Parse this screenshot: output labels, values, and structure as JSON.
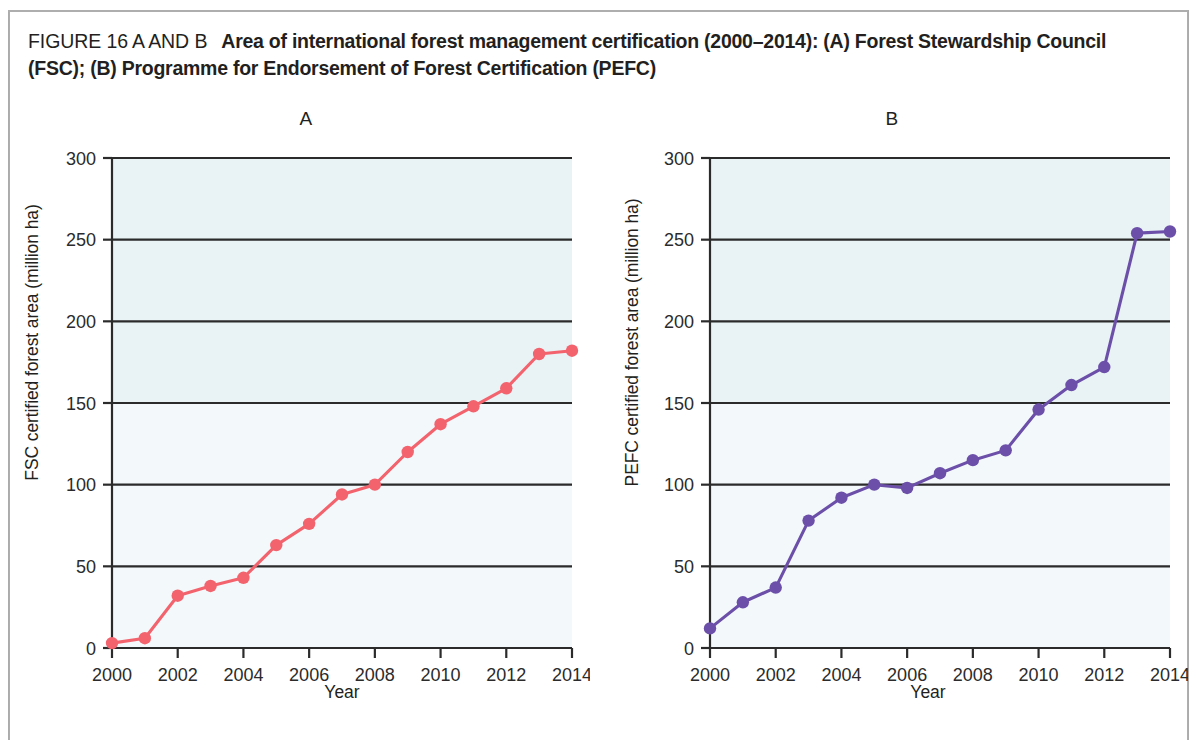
{
  "caption": {
    "figure_label": "FIGURE 16 A AND B",
    "title": "Area of international forest management certification (2000–2014): (A) Forest Stewardship Council (FSC); (B) Programme for Endorsement of Forest Certification (PEFC)"
  },
  "colors": {
    "panel_a_series": "#f2636e",
    "panel_b_series": "#6b4fa8",
    "plot_band_tint": "#e9f2f5",
    "axis": "#2b2b2b",
    "text": "#231f20"
  },
  "chart_data": [
    {
      "type": "line",
      "title": "A",
      "xlabel": "Year",
      "ylabel": "FSC certified forest area (million ha)",
      "x": [
        2000,
        2001,
        2002,
        2003,
        2004,
        2005,
        2006,
        2007,
        2008,
        2009,
        2010,
        2011,
        2012,
        2013,
        2014
      ],
      "values": [
        3,
        6,
        32,
        38,
        43,
        63,
        76,
        94,
        100,
        120,
        137,
        148,
        159,
        180,
        182
      ],
      "xtick_labels": [
        "2000",
        "2002",
        "2004",
        "2006",
        "2008",
        "2010",
        "2012",
        "2014"
      ],
      "xticks": [
        2000,
        2002,
        2004,
        2006,
        2008,
        2010,
        2012,
        2014
      ],
      "ytick_labels": [
        "0",
        "50",
        "100",
        "150",
        "200",
        "250",
        "300"
      ],
      "yticks": [
        0,
        50,
        100,
        150,
        200,
        250,
        300
      ],
      "xlim": [
        2000,
        2014
      ],
      "ylim": [
        0,
        300
      ],
      "grid": true,
      "legend": "none",
      "series_color": "#f2636e",
      "marker": "circle"
    },
    {
      "type": "line",
      "title": "B",
      "xlabel": "Year",
      "ylabel": "PEFC certified forest area (million ha)",
      "x": [
        2000,
        2001,
        2002,
        2003,
        2004,
        2005,
        2006,
        2007,
        2008,
        2009,
        2010,
        2011,
        2012,
        2013,
        2014
      ],
      "values": [
        12,
        28,
        37,
        78,
        92,
        100,
        98,
        107,
        115,
        121,
        146,
        161,
        172,
        254,
        255
      ],
      "xtick_labels": [
        "2000",
        "2002",
        "2004",
        "2006",
        "2008",
        "2010",
        "2012",
        "2014"
      ],
      "xticks": [
        2000,
        2002,
        2004,
        2006,
        2008,
        2010,
        2012,
        2014
      ],
      "ytick_labels": [
        "0",
        "50",
        "100",
        "150",
        "200",
        "250",
        "300"
      ],
      "yticks": [
        0,
        50,
        100,
        150,
        200,
        250,
        300
      ],
      "xlim": [
        2000,
        2014
      ],
      "ylim": [
        0,
        300
      ],
      "grid": true,
      "legend": "none",
      "series_color": "#6b4fa8",
      "marker": "circle"
    }
  ]
}
